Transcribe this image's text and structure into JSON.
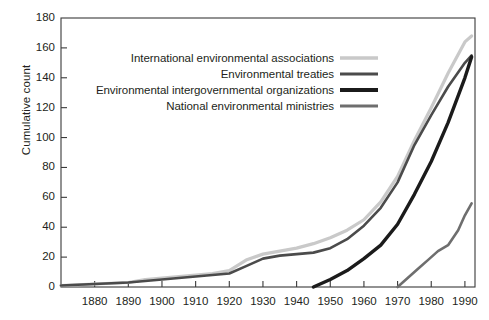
{
  "chart_data": {
    "type": "line",
    "title": "",
    "xlabel": "",
    "ylabel": "Cumulative count",
    "xlim": [
      1870,
      1993
    ],
    "ylim": [
      0,
      180
    ],
    "grid": false,
    "legend_position": "upper-center-right",
    "x_ticks": [
      "1880",
      "1890",
      "1900",
      "1910",
      "1920",
      "1930",
      "1940",
      "1950",
      "1960",
      "1970",
      "1980",
      "1990"
    ],
    "x_tick_values": [
      1880,
      1890,
      1900,
      1910,
      1920,
      1930,
      1940,
      1950,
      1960,
      1970,
      1980,
      1990
    ],
    "y_ticks": [
      "0",
      "20",
      "40",
      "60",
      "80",
      "100",
      "120",
      "140",
      "160",
      "180"
    ],
    "y_tick_values": [
      0,
      20,
      40,
      60,
      80,
      100,
      120,
      140,
      160,
      180
    ],
    "series": [
      {
        "name": "International environmental associations",
        "color": "#c9c9c9",
        "width": 3.2,
        "x": [
          1870,
          1880,
          1890,
          1895,
          1900,
          1905,
          1910,
          1915,
          1920,
          1925,
          1930,
          1935,
          1940,
          1945,
          1950,
          1955,
          1960,
          1965,
          1970,
          1975,
          1980,
          1985,
          1990,
          1992
        ],
        "values": [
          1,
          2,
          3,
          5,
          6,
          7,
          8,
          9,
          11,
          18,
          22,
          24,
          26,
          29,
          33,
          38,
          45,
          57,
          74,
          98,
          120,
          143,
          164,
          168
        ]
      },
      {
        "name": "Environmental treaties",
        "color": "#4b4b4b",
        "width": 2.6,
        "x": [
          1870,
          1880,
          1890,
          1895,
          1900,
          1905,
          1910,
          1915,
          1920,
          1925,
          1930,
          1935,
          1940,
          1945,
          1950,
          1955,
          1960,
          1965,
          1970,
          1975,
          1980,
          1985,
          1990,
          1992
        ],
        "values": [
          1,
          2,
          3,
          4,
          5,
          6,
          7,
          8,
          9,
          14,
          19,
          21,
          22,
          23,
          26,
          32,
          41,
          53,
          70,
          95,
          115,
          134,
          150,
          155
        ]
      },
      {
        "name": "Environmental intergovernmental organizations",
        "color": "#1b1b1b",
        "width": 3.4,
        "x": [
          1945,
          1948,
          1950,
          1955,
          1960,
          1965,
          1970,
          1975,
          1980,
          1985,
          1990,
          1992
        ],
        "values": [
          0,
          3,
          5,
          11,
          19,
          28,
          42,
          62,
          84,
          110,
          140,
          154
        ]
      },
      {
        "name": "National environmental ministries",
        "color": "#6e6e6e",
        "width": 2.6,
        "x": [
          1970,
          1973,
          1976,
          1979,
          1982,
          1985,
          1988,
          1990,
          1992
        ],
        "values": [
          0,
          6,
          12,
          18,
          24,
          28,
          38,
          48,
          56
        ]
      }
    ]
  },
  "legend": {
    "items": [
      {
        "label": "International environmental associations",
        "color": "#c9c9c9",
        "width": 3.4
      },
      {
        "label": "Environmental treaties",
        "color": "#4b4b4b",
        "width": 3.0
      },
      {
        "label": "Environmental intergovernmental organizations",
        "color": "#1b1b1b",
        "width": 3.8
      },
      {
        "label": "National environmental ministries",
        "color": "#6e6e6e",
        "width": 3.0
      }
    ]
  }
}
